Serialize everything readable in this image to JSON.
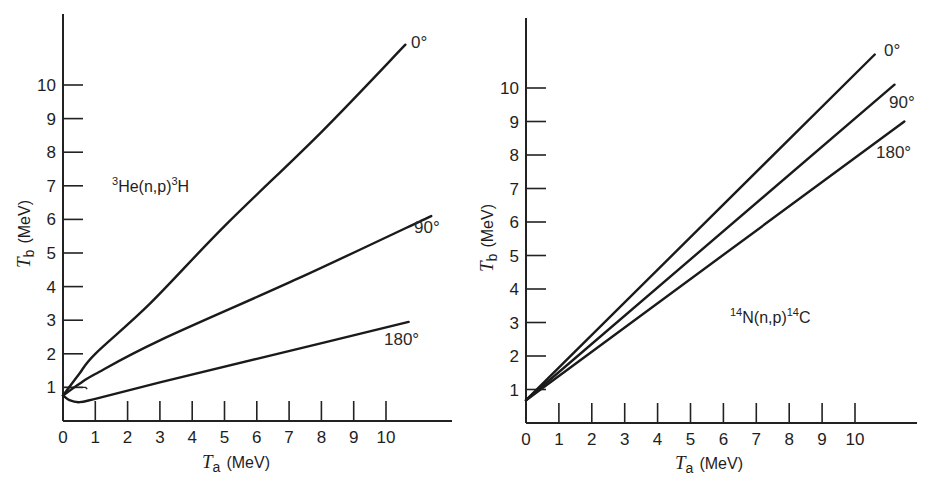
{
  "chart_data": [
    {
      "type": "line",
      "title": "",
      "annotation": "3He(n,p)3H",
      "reaction": {
        "pre_sup": "3",
        "target": "He(n,p)",
        "post_sup": "3",
        "product": "H"
      },
      "xlabel": "T_a (MeV)",
      "ylabel": "T_b (MeV)",
      "xlabel_sym": "T",
      "xlabel_sub": "a",
      "xlabel_unit": "(MeV)",
      "ylabel_sym": "T",
      "ylabel_sub": "b",
      "ylabel_unit": "(MeV)",
      "xlim": [
        0,
        12
      ],
      "ylim": [
        0,
        12
      ],
      "xticks": [
        0,
        1,
        2,
        3,
        4,
        5,
        6,
        7,
        8,
        9,
        10
      ],
      "yticks": [
        1,
        2,
        3,
        4,
        5,
        6,
        7,
        8,
        9,
        10
      ],
      "grid": false,
      "series": [
        {
          "name": "0°",
          "x": [
            0,
            0.5,
            1,
            2.7,
            5,
            8,
            10.6
          ],
          "y": [
            0.76,
            1.4,
            2.0,
            3.5,
            5.8,
            8.6,
            11.2
          ]
        },
        {
          "name": "90°",
          "x": [
            0,
            0.5,
            1,
            3,
            7.3,
            11.4
          ],
          "y": [
            0.76,
            1.1,
            1.4,
            2.4,
            4.25,
            6.1
          ]
        },
        {
          "name": "180°",
          "x": [
            0,
            0.2,
            0.5,
            1,
            3,
            6,
            10.7
          ],
          "y": [
            0.76,
            0.62,
            0.56,
            0.66,
            1.15,
            1.85,
            2.95
          ]
        }
      ]
    },
    {
      "type": "line",
      "title": "",
      "annotation": "14N(n,p)14C",
      "reaction": {
        "pre_sup": "14",
        "target": "N(n,p)",
        "post_sup": "14",
        "product": "C"
      },
      "xlabel": "T_a (MeV)",
      "ylabel": "T_b (MeV)",
      "xlabel_sym": "T",
      "xlabel_sub": "a",
      "xlabel_unit": "(MeV)",
      "ylabel_sym": "T",
      "ylabel_sub": "b",
      "ylabel_unit": "(MeV)",
      "xlim": [
        0,
        12
      ],
      "ylim": [
        0,
        12
      ],
      "xticks": [
        0,
        1,
        2,
        3,
        4,
        5,
        6,
        7,
        8,
        9,
        10
      ],
      "yticks": [
        1,
        2,
        3,
        4,
        5,
        6,
        7,
        8,
        9,
        10
      ],
      "grid": false,
      "series": [
        {
          "name": "0°",
          "x": [
            0,
            10.6
          ],
          "y": [
            0.68,
            11.0
          ]
        },
        {
          "name": "90°",
          "x": [
            0,
            11.2
          ],
          "y": [
            0.68,
            10.1
          ]
        },
        {
          "name": "180°",
          "x": [
            0,
            11.5
          ],
          "y": [
            0.68,
            9.0
          ]
        }
      ]
    }
  ]
}
